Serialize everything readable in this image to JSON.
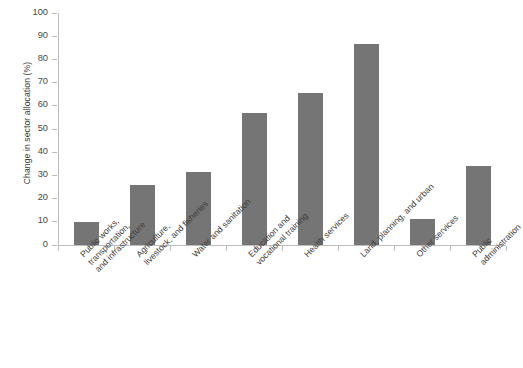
{
  "chart_data": {
    "type": "bar",
    "title": "",
    "subtitle": "",
    "xlabel": "",
    "ylabel": "Change in sector allocation (%)",
    "ylim": [
      0,
      100
    ],
    "ytick_step": 10,
    "yticks": [
      "100",
      "90",
      "80",
      "70",
      "60",
      "50",
      "40",
      "30",
      "20",
      "10",
      "0"
    ],
    "grid": false,
    "legend": false,
    "legend_position": "none",
    "bar_color": "#757575",
    "axis_color": "#bdbdbd",
    "text_color": "#3c3c3c",
    "categories": [
      "Public works, transportation, and infrastructure",
      "Agriculture, livestock, and fisheries",
      "Water and sanitation",
      "Education and vocational training",
      "Health services",
      "Land, planning, and urban",
      "Other services",
      "Public administration"
    ],
    "category_lines": [
      [
        "Public works,",
        "transportation,",
        "and infrastructure"
      ],
      [
        "Agriculture,",
        "livestock, and fisheries"
      ],
      [
        "Water and sanitation"
      ],
      [
        "Education and",
        "vocational training"
      ],
      [
        "Health services"
      ],
      [
        "Land, planning, and urban"
      ],
      [
        "Other services"
      ],
      [
        "Public",
        "administration"
      ]
    ],
    "values": [
      9.8,
      25.8,
      31.5,
      57.0,
      65.5,
      86.5,
      11.3,
      34.0
    ]
  }
}
